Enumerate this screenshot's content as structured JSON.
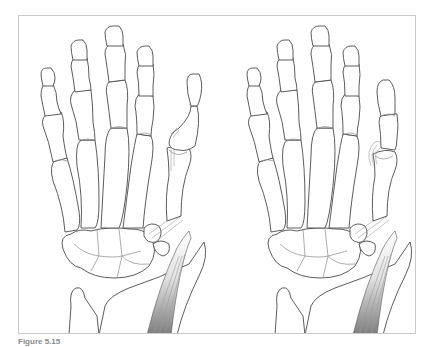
{
  "figure": {
    "caption_label": "Figure 5.15",
    "caption_text": "",
    "panels": [
      {
        "name": "left-hand",
        "description": "Dorsal skeletal hand with thumb metacarpophalangeal joint fracture fragment and tendon"
      },
      {
        "name": "right-hand",
        "description": "Dorsal skeletal hand with displaced thumb fragment (Stener-type lesion) and tendon"
      }
    ],
    "colors": {
      "line": "#4a4a4a",
      "frame": "#c9c9c9",
      "tendon_dark": "#7a7a7a",
      "tendon_light": "#e6e6e6"
    }
  }
}
